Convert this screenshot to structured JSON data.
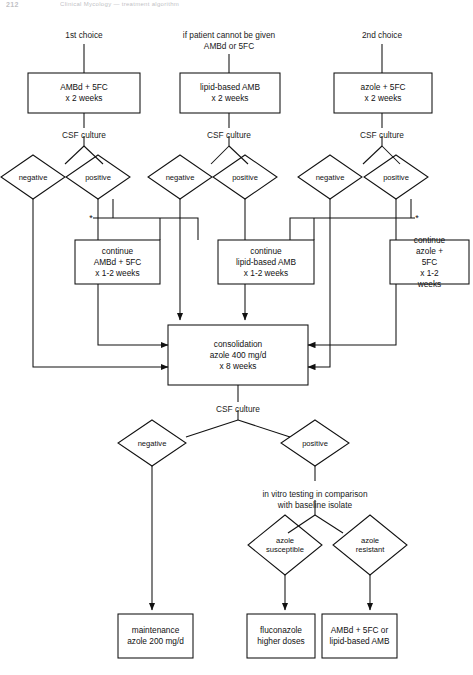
{
  "page_header": {
    "page_number": "212",
    "running_title": "Clinical Mycology — treatment algorithm"
  },
  "column_headings": [
    {
      "id": "col1",
      "text": "1st choice",
      "x": 84,
      "y": 30
    },
    {
      "id": "col2",
      "text": "if patient cannot be given\nAMBd or 5FC",
      "x": 229,
      "y": 30
    },
    {
      "id": "col3",
      "text": "2nd choice",
      "x": 382,
      "y": 30
    }
  ],
  "induction_boxes": [
    {
      "id": "ambd-5fc",
      "text": "AMBd + 5FC\nx  2 weeks",
      "x": 28,
      "y": 73,
      "w": 112,
      "h": 40
    },
    {
      "id": "lipid-amb",
      "text": "lipid-based AMB\nx 2 weeks",
      "x": 180,
      "y": 73,
      "w": 100,
      "h": 40
    },
    {
      "id": "azole-5fc",
      "text": "azole + 5FC\nx 2 weeks",
      "x": 334,
      "y": 73,
      "w": 98,
      "h": 40
    }
  ],
  "csf_culture_labels": [
    {
      "id": "csf1",
      "text": "CSF culture",
      "x": 84,
      "y": 130
    },
    {
      "id": "csf2",
      "text": "CSF culture",
      "x": 229,
      "y": 130
    },
    {
      "id": "csf3",
      "text": "CSF culture",
      "x": 382,
      "y": 130
    },
    {
      "id": "csf4",
      "text": "CSF culture",
      "x": 238,
      "y": 404
    }
  ],
  "top_diamonds": [
    {
      "id": "neg1",
      "text": "negative",
      "cx": 33,
      "cy": 177,
      "rx": 32,
      "ry": 22
    },
    {
      "id": "pos1",
      "text": "positive",
      "cx": 98,
      "cy": 177,
      "rx": 32,
      "ry": 22
    },
    {
      "id": "neg2",
      "text": "negative",
      "cx": 180,
      "cy": 177,
      "rx": 32,
      "ry": 22
    },
    {
      "id": "pos2",
      "text": "positive",
      "cx": 245,
      "cy": 177,
      "rx": 32,
      "ry": 22
    },
    {
      "id": "neg3",
      "text": "negative",
      "cx": 330,
      "cy": 177,
      "rx": 32,
      "ry": 22
    },
    {
      "id": "pos3",
      "text": "positive",
      "cx": 396,
      "cy": 177,
      "rx": 32,
      "ry": 22
    }
  ],
  "continue_boxes": [
    {
      "id": "cont-ambd",
      "text": "continue\nAMBd + 5FC\nx 1-2 weeks",
      "x": 75,
      "y": 240,
      "w": 85,
      "h": 44
    },
    {
      "id": "cont-lipid",
      "text": "continue\nlipid-based AMB\nx 1-2 weeks",
      "x": 218,
      "y": 240,
      "w": 96,
      "h": 44
    },
    {
      "id": "cont-azole",
      "text": "continue\nazole + 5FC\nx 1-2 weeks",
      "x": 390,
      "y": 240,
      "w": 79,
      "h": 44
    }
  ],
  "asterisks": [
    {
      "id": "asterisk-left",
      "x": 91,
      "y": 218
    },
    {
      "id": "asterisk-right",
      "x": 417,
      "y": 218
    }
  ],
  "consolidation_box": {
    "id": "consolidation",
    "text": "consolidation\nazole 400 mg/d\nx 8 weeks",
    "x": 168,
    "y": 325,
    "w": 140,
    "h": 60
  },
  "lower_diamonds": [
    {
      "id": "neg-final",
      "text": "negative",
      "cx": 152,
      "cy": 443,
      "rx": 34,
      "ry": 23
    },
    {
      "id": "pos-final",
      "text": "positive",
      "cx": 315,
      "cy": 443,
      "rx": 34,
      "ry": 23
    }
  ],
  "in_vitro_label": {
    "id": "in-vitro",
    "text": "in vitro testing in comparison\nwith baseline isolate",
    "x": 315,
    "y": 489
  },
  "susceptibility_diamonds": [
    {
      "id": "azole-susceptible",
      "text": "azole\nsusceptible",
      "cx": 285,
      "cy": 545,
      "rx": 37,
      "ry": 30
    },
    {
      "id": "azole-resistant",
      "text": "azole\nresistant",
      "cx": 370,
      "cy": 545,
      "rx": 37,
      "ry": 30
    }
  ],
  "outcome_boxes": [
    {
      "id": "maintenance",
      "text": "maintenance\nazole 200 mg/d",
      "x": 118,
      "y": 614,
      "w": 75,
      "h": 44
    },
    {
      "id": "fluconazole",
      "text": "fluconazole\nhigher doses",
      "x": 247,
      "y": 614,
      "w": 68,
      "h": 44
    },
    {
      "id": "amb-or-lipid",
      "text": "AMBd + 5FC or\nlipid-based AMB",
      "x": 322,
      "y": 614,
      "w": 75,
      "h": 44
    }
  ],
  "colors": {
    "stroke": "#111111",
    "text": "#111111",
    "background": "#ffffff",
    "header_text": "#8d8d94"
  }
}
